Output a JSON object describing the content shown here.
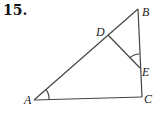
{
  "problem": {
    "number": "15."
  },
  "figure": {
    "points": {
      "A": {
        "label": "A",
        "x": 34,
        "y": 100
      },
      "B": {
        "label": "B",
        "x": 138,
        "y": 9
      },
      "C": {
        "label": "C",
        "x": 142,
        "y": 97
      },
      "D": {
        "label": "D",
        "x": 108,
        "y": 35
      },
      "E": {
        "label": "E",
        "x": 140,
        "y": 68
      }
    },
    "segments": [
      "AB",
      "BC",
      "AC",
      "DE"
    ],
    "angle_marks": [
      "angle A",
      "angle DEB"
    ],
    "line_color": "#444444"
  }
}
